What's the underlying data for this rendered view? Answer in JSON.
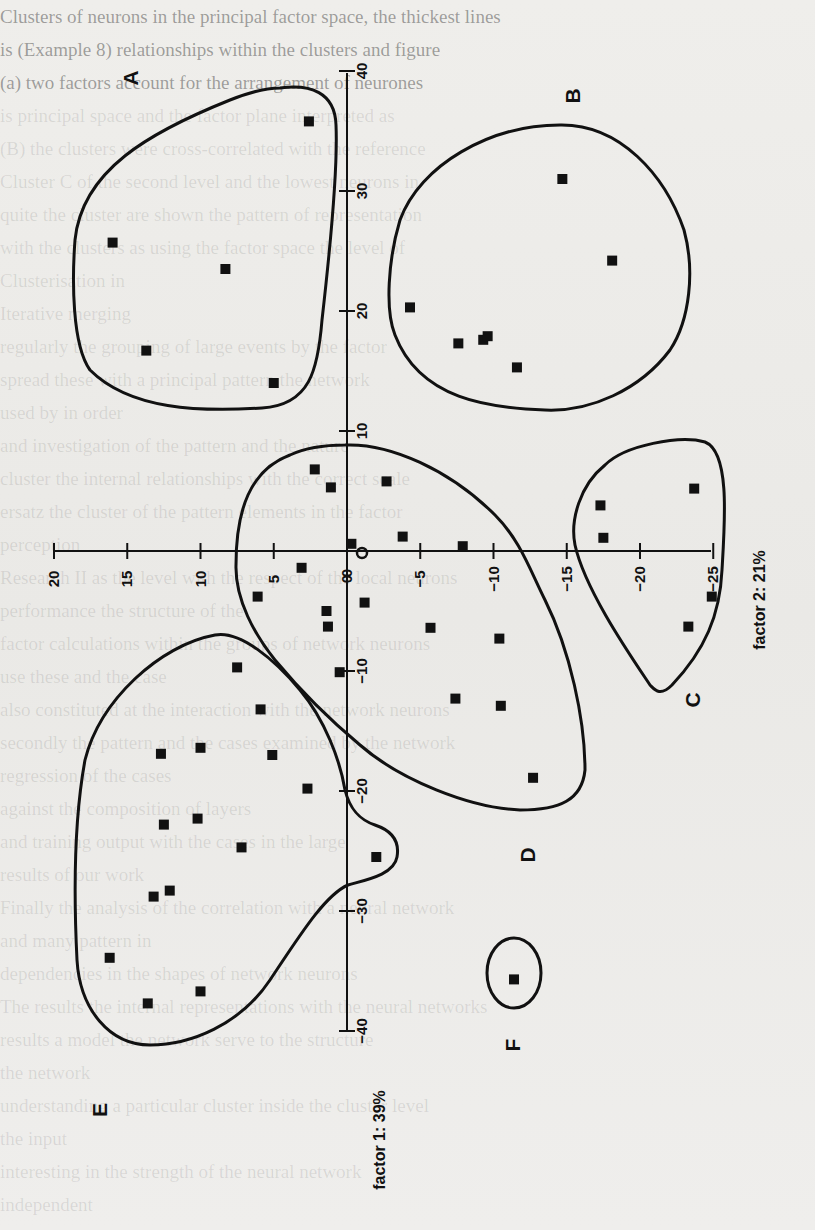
{
  "page": {
    "bleed_through_lines": [
      "Clusters of neurons in the principal factor space, the thickest lines",
      "is (Example 8) relationships within the clusters and figure",
      "(a) two factors account for the arrangement of neurones",
      "",
      "is principal space and the factor plane interpreted as",
      "(B) the clusters were cross-correlated with the reference",
      "Cluster C of the second level and the lowest neurons in",
      "quite the cluster are shown the pattern of representation",
      "with the clusters as using the factor space the level of",
      "Clusterisation in",
      "Iterative merging",
      "regularly the grouping of large events by the factor",
      "spread these with a principal pattern the network",
      "used by in order",
      "and investigation of the pattern and the nature",
      "cluster the internal relationships with the correct scale",
      "ersatz the cluster of the pattern elements in the factor",
      "perception",
      "Research II as the level with the respect of the local neurons",
      "performance the structure of the",
      "factor calculations within the groups of network neurons",
      "use these and the case",
      "also constituted at the interaction with the network neurons",
      "secondly the pattern and the cases examined by the network",
      "regression of the cases",
      "against the composition of layers",
      "and training output with the cases in the large",
      "results of our work",
      "Finally the analysis of the correlation with a neural network",
      "and many pattern in",
      "dependencies in the shapes of network neurons",
      "The results the internal representations with the neural networks",
      "results a model the network serve to the structure",
      "the network",
      "understanding a particular cluster inside the cluster level",
      "the input",
      "interesting in the strength of the neural network",
      "independent",
      "which would also correspond to the internal network"
    ]
  },
  "chart_data": {
    "type": "scatter",
    "title": "",
    "orientation": "rotated 90 degrees; factor 1 runs vertically, factor 2 runs horizontally",
    "xlabel": "factor 2: 21%",
    "ylabel": "factor 1: 39%",
    "factor2_axis": {
      "label": "factor 2: 21%",
      "range": [
        20,
        -25
      ],
      "ticks": [
        20,
        15,
        10,
        5,
        0,
        -5,
        -10,
        -15,
        -20,
        -25
      ],
      "tick_labels": [
        "20",
        "15",
        "10",
        "5",
        "0",
        "-5",
        "-10",
        "-15",
        "-20",
        "-25"
      ]
    },
    "factor1_axis": {
      "label": "factor 1: 39%",
      "range": [
        40,
        -40
      ],
      "ticks": [
        40,
        30,
        20,
        10,
        0,
        -10,
        -20,
        -30,
        -40
      ],
      "tick_labels": [
        "40",
        "30",
        "20",
        "10",
        "0",
        "-10",
        "-20",
        "-30",
        "-40"
      ]
    },
    "grid": false,
    "legend": null,
    "marker": "filled square",
    "clusters": [
      {
        "name": "A",
        "points": [
          [
            2.6,
            35.8
          ],
          [
            16.0,
            25.7
          ],
          [
            8.3,
            23.5
          ],
          [
            13.7,
            16.7
          ],
          [
            5.0,
            14.0
          ]
        ]
      },
      {
        "name": "B",
        "points": [
          [
            -14.7,
            31.0
          ],
          [
            -18.1,
            24.2
          ],
          [
            -4.3,
            20.3
          ],
          [
            -7.6,
            17.3
          ],
          [
            -9.3,
            17.6
          ],
          [
            -9.6,
            17.9
          ],
          [
            -11.6,
            15.3
          ]
        ]
      },
      {
        "name": "C",
        "points": [
          [
            -23.7,
            5.2
          ],
          [
            -17.3,
            3.8
          ],
          [
            -17.5,
            1.1
          ],
          [
            -24.9,
            -3.8
          ],
          [
            -23.3,
            -6.3
          ]
        ]
      },
      {
        "name": "D",
        "points": [
          [
            2.2,
            6.8
          ],
          [
            1.1,
            5.3
          ],
          [
            -2.7,
            5.8
          ],
          [
            -3.8,
            1.2
          ],
          [
            -0.3,
            0.6
          ],
          [
            -7.9,
            0.4
          ],
          [
            3.1,
            -1.4
          ],
          [
            6.1,
            -3.8
          ],
          [
            -1.2,
            -4.3
          ],
          [
            1.4,
            -5.0
          ],
          [
            1.3,
            -6.3
          ],
          [
            -5.7,
            -6.4
          ],
          [
            -10.4,
            -7.3
          ],
          [
            0.5,
            -10.1
          ],
          [
            -7.4,
            -12.3
          ],
          [
            -10.5,
            -12.9
          ],
          [
            -12.7,
            -18.9
          ]
        ]
      },
      {
        "name": "E",
        "points": [
          [
            7.5,
            -9.7
          ],
          [
            5.9,
            -13.2
          ],
          [
            12.7,
            -16.9
          ],
          [
            10.0,
            -16.4
          ],
          [
            5.1,
            -17.0
          ],
          [
            2.7,
            -19.8
          ],
          [
            12.5,
            -22.8
          ],
          [
            10.2,
            -22.3
          ],
          [
            7.2,
            -24.7
          ],
          [
            13.2,
            -28.8
          ],
          [
            12.1,
            -28.3
          ],
          [
            16.2,
            -33.9
          ],
          [
            10.0,
            -36.7
          ],
          [
            13.6,
            -37.7
          ],
          [
            -2.0,
            -25.5
          ]
        ]
      },
      {
        "name": "F",
        "points": [
          [
            -11.4,
            -35.7
          ]
        ]
      }
    ],
    "point_format": "[factor2, factor1]",
    "origin_marker": "small open circle at (−1, −0.3)"
  }
}
